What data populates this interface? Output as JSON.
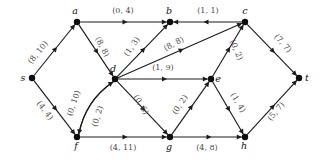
{
  "diagram": {
    "label_format": "(flow, capacity)",
    "nodes": [
      {
        "id": "s",
        "label": "s",
        "x": 32,
        "y": 78,
        "label_dx": -9,
        "label_dy": 3
      },
      {
        "id": "a",
        "label": "a",
        "x": 77,
        "y": 22,
        "label_dx": -2,
        "label_dy": -8
      },
      {
        "id": "b",
        "label": "b",
        "x": 170,
        "y": 22,
        "label_dx": -1,
        "label_dy": -8
      },
      {
        "id": "c",
        "label": "c",
        "x": 245,
        "y": 22,
        "label_dx": 0,
        "label_dy": -8
      },
      {
        "id": "d",
        "label": "d",
        "x": 115,
        "y": 79,
        "label_dx": -2,
        "label_dy": -7
      },
      {
        "id": "e",
        "label": "e",
        "x": 211,
        "y": 79,
        "label_dx": 7,
        "label_dy": 3
      },
      {
        "id": "t",
        "label": "t",
        "x": 299,
        "y": 78,
        "label_dx": 8,
        "label_dy": 3
      },
      {
        "id": "f",
        "label": "f",
        "x": 77,
        "y": 137,
        "label_dx": -1,
        "label_dy": 12
      },
      {
        "id": "g",
        "label": "g",
        "x": 170,
        "y": 137,
        "label_dx": -1,
        "label_dy": 13
      },
      {
        "id": "h",
        "label": "h",
        "x": 245,
        "y": 137,
        "label_dx": -1,
        "label_dy": 12
      }
    ],
    "edges": [
      {
        "id": "s-a",
        "from": "s",
        "to": "a",
        "flow": 8,
        "capacity": 10,
        "label": "(8, 10)",
        "label_x": 40,
        "label_y": 54,
        "rotate": -51,
        "curved": false
      },
      {
        "id": "s-f",
        "from": "s",
        "to": "f",
        "flow": 4,
        "capacity": 4,
        "label": "(4, 4)",
        "label_x": 43,
        "label_y": 112,
        "rotate": 52,
        "curved": false
      },
      {
        "id": "a-b",
        "from": "a",
        "to": "b",
        "flow": 0,
        "capacity": 4,
        "label": "(0, 4)",
        "label_x": 123,
        "label_y": 13,
        "rotate": 0,
        "curved": false
      },
      {
        "id": "a-d",
        "from": "a",
        "to": "d",
        "flow": 8,
        "capacity": 8,
        "label": "(8, 8)",
        "label_x": 100,
        "label_y": 48,
        "rotate": 62,
        "curved": false
      },
      {
        "id": "d-b",
        "from": "d",
        "to": "b",
        "flow": 1,
        "capacity": 3,
        "label": "(1, 3)",
        "label_x": 134,
        "label_y": 48,
        "rotate": -55,
        "curved": false
      },
      {
        "id": "d-c",
        "from": "d",
        "to": "c",
        "flow": 8,
        "capacity": 8,
        "label": "(8, 8)",
        "label_x": 175,
        "label_y": 46,
        "rotate": -28,
        "curved": false
      },
      {
        "id": "c-b",
        "from": "c",
        "to": "b",
        "flow": 1,
        "capacity": 1,
        "label": "(1, 1)",
        "label_x": 208,
        "label_y": 13,
        "rotate": 0,
        "curved": false
      },
      {
        "id": "c-t",
        "from": "c",
        "to": "t",
        "flow": 7,
        "capacity": 7,
        "label": "(7, 7)",
        "label_x": 281,
        "label_y": 45,
        "rotate": 48,
        "curved": false
      },
      {
        "id": "e-c",
        "from": "e",
        "to": "c",
        "flow": 0,
        "capacity": 2,
        "label": "(0, 2)",
        "label_x": 234,
        "label_y": 51,
        "rotate": 67,
        "curved": false
      },
      {
        "id": "d-e",
        "from": "d",
        "to": "e",
        "flow": 1,
        "capacity": 9,
        "label": "(1, 9)",
        "label_x": 163,
        "label_y": 70,
        "rotate": 0,
        "curved": false
      },
      {
        "id": "f-d",
        "from": "f",
        "to": "d",
        "flow": 0,
        "capacity": 10,
        "label": "(0, 10)",
        "label_x": 76,
        "label_y": 104,
        "rotate": -71,
        "curved": true
      },
      {
        "id": "d-f",
        "from": "d",
        "to": "f",
        "flow": 0,
        "capacity": 2,
        "label": "(0, 2)",
        "label_x": 100,
        "label_y": 117,
        "rotate": -72,
        "curved": true
      },
      {
        "id": "d-g",
        "from": "d",
        "to": "g",
        "flow": 0,
        "capacity": 6,
        "label": "(0, 6)",
        "label_x": 139,
        "label_y": 106,
        "rotate": 58,
        "curved": false
      },
      {
        "id": "g-e",
        "from": "g",
        "to": "e",
        "flow": 0,
        "capacity": 2,
        "label": "(0, 2)",
        "label_x": 182,
        "label_y": 106,
        "rotate": -57,
        "curved": false
      },
      {
        "id": "e-h",
        "from": "e",
        "to": "h",
        "flow": 1,
        "capacity": 4,
        "label": "(1, 4)",
        "label_x": 236,
        "label_y": 104,
        "rotate": 58,
        "curved": false
      },
      {
        "id": "f-g",
        "from": "f",
        "to": "g",
        "flow": 4,
        "capacity": 11,
        "label": "(4, 11)",
        "label_x": 123,
        "label_y": 150,
        "rotate": 0,
        "curved": false
      },
      {
        "id": "g-h",
        "from": "g",
        "to": "h",
        "flow": 4,
        "capacity": 8,
        "label": "(4, 8)",
        "label_x": 207,
        "label_y": 150,
        "rotate": 0,
        "curved": false
      },
      {
        "id": "h-t",
        "from": "h",
        "to": "t",
        "flow": 5,
        "capacity": 7,
        "label": "(5, 7)",
        "label_x": 278,
        "label_y": 113,
        "rotate": -50,
        "curved": false
      }
    ]
  }
}
